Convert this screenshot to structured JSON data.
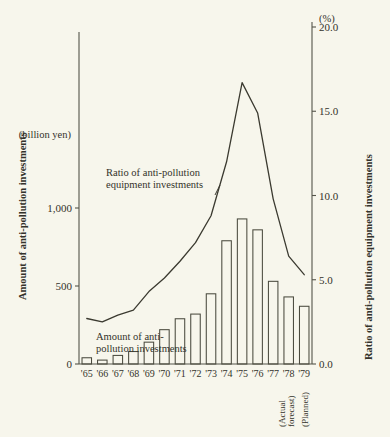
{
  "chart_data": {
    "type": "bar",
    "title": "",
    "categories": [
      "'65",
      "'66",
      "'67",
      "'68",
      "'69",
      "'70",
      "'71",
      "'72",
      "'73",
      "'74",
      "'75",
      "'76",
      "'77",
      "'78",
      "'79"
    ],
    "series": [
      {
        "name": "Amount of anti-pollution investments",
        "type": "bar",
        "axis": "left",
        "unit": "billion yen",
        "values": [
          40,
          25,
          55,
          80,
          140,
          220,
          290,
          320,
          450,
          790,
          930,
          860,
          530,
          430,
          370
        ]
      },
      {
        "name": "Ratio of anti-pollution equipment investments",
        "type": "line",
        "axis": "right",
        "unit": "%",
        "values": [
          2.7,
          2.5,
          2.9,
          3.2,
          4.3,
          5.1,
          6.1,
          7.2,
          8.8,
          12.0,
          16.7,
          14.9,
          9.8,
          6.4,
          5.3
        ]
      }
    ],
    "left_axis": {
      "label": "Amount of anti-pollution investments",
      "unit_label": "(billion yen)",
      "ticks": [
        "0",
        "500",
        "1,000"
      ],
      "tick_values": [
        0,
        500,
        1000
      ],
      "ylim": [
        0,
        1030
      ]
    },
    "right_axis": {
      "label": "Ratio of anti-pollution equipment investments",
      "unit_label": "(%)",
      "ticks": [
        "0.0",
        "5.0",
        "10.0",
        "15.0",
        "20.0"
      ],
      "tick_values": [
        0,
        5,
        10,
        15,
        20
      ],
      "ylim": [
        0,
        20
      ]
    },
    "xlabel": "",
    "grid": false,
    "legend_position": "inline-annotations",
    "annotations": [
      {
        "name": "ratio-series-label",
        "text_line1": "Ratio of anti-pollution",
        "text_line2": "equipment investments"
      },
      {
        "name": "amount-series-label",
        "text_line1": "Amount of anti-",
        "text_line2": "pollution investments"
      },
      {
        "name": "note-78",
        "text_line1": "(Actual",
        "text_line2": "forecast)",
        "category": "'78"
      },
      {
        "name": "note-79",
        "text_line1": "(Planned)",
        "text_line2": "",
        "category": "'79"
      }
    ],
    "colors": {
      "background": "#f7f6ec",
      "ink": "#33322a",
      "axis": "#54544a",
      "bar_stroke": "#4a4a3e",
      "line_stroke": "#3b3a30"
    }
  }
}
